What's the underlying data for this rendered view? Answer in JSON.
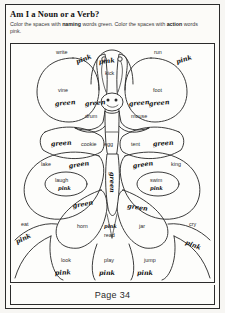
{
  "page": {
    "title": "Am I a Noun or a Verb?",
    "instruction_line1_pre": "Color the spaces with ",
    "instruction_line1_bold": "naming",
    "instruction_line1_post": " words green. Color the spaces with",
    "instruction_line2_bold": "action",
    "instruction_line2_post": " words pink.",
    "footer": "Page 34"
  },
  "legend": {
    "noun_color_word": "green",
    "verb_color_word": "pink",
    "green_hex": "#1e7a3c",
    "pink_hex": "#e06aa0"
  },
  "butterfly": {
    "description": "butterfly coloring diagram with word-filled wing spaces"
  },
  "cells": [
    {
      "id": "c01",
      "word": "write",
      "answer": "pink",
      "type": "verb"
    },
    {
      "id": "c02",
      "word": "kick",
      "answer": "pink",
      "type": "verb"
    },
    {
      "id": "c03",
      "word": "run",
      "answer": "pink",
      "type": "verb"
    },
    {
      "id": "c04",
      "word": "vine",
      "answer": "green",
      "type": "noun"
    },
    {
      "id": "c05",
      "word": "drum",
      "answer": "green",
      "type": "noun"
    },
    {
      "id": "c06",
      "word": "mouse",
      "answer": "green",
      "type": "noun"
    },
    {
      "id": "c07",
      "word": "foot",
      "answer": "green",
      "type": "noun"
    },
    {
      "id": "c08",
      "word": "cookie",
      "answer": "green",
      "type": "noun"
    },
    {
      "id": "c09",
      "word": "egg",
      "answer": "",
      "type": "noun"
    },
    {
      "id": "c10",
      "word": "tent",
      "answer": "green",
      "type": "noun"
    },
    {
      "id": "c11",
      "word": "lake",
      "answer": "green",
      "type": "noun"
    },
    {
      "id": "c12",
      "word": "king",
      "answer": "green",
      "type": "noun"
    },
    {
      "id": "c13",
      "word": "laugh",
      "answer": "pink",
      "type": "verb"
    },
    {
      "id": "c14",
      "word": "swim",
      "answer": "pink",
      "type": "verb"
    },
    {
      "id": "c15",
      "word": "body",
      "answer": "green",
      "type": "noun"
    },
    {
      "id": "c16",
      "word": "eat",
      "answer": "pink",
      "type": "verb"
    },
    {
      "id": "c17",
      "word": "horn",
      "answer": "green",
      "type": "noun"
    },
    {
      "id": "c18",
      "word": "read",
      "answer": "pink",
      "type": "verb"
    },
    {
      "id": "c19",
      "word": "jar",
      "answer": "green",
      "type": "noun"
    },
    {
      "id": "c20",
      "word": "cry",
      "answer": "pink",
      "type": "verb"
    },
    {
      "id": "c21",
      "word": "look",
      "answer": "pink",
      "type": "verb"
    },
    {
      "id": "c22",
      "word": "play",
      "answer": "pink",
      "type": "verb"
    },
    {
      "id": "c23",
      "word": "jump",
      "answer": "pink",
      "type": "verb"
    }
  ],
  "labels": {
    "write": "write",
    "kick": "kick",
    "run": "run",
    "vine": "vine",
    "drum": "drum",
    "mouse": "mouse",
    "foot": "foot",
    "cookie": "cookie",
    "egg": "egg",
    "tent": "tent",
    "lake": "lake",
    "king": "king",
    "laugh": "laugh",
    "swim": "swim",
    "eat": "eat",
    "horn": "horn",
    "read": "read",
    "jar": "jar",
    "cry": "cry",
    "look": "look",
    "play": "play",
    "jump": "jump",
    "pink_a": "pink",
    "pink_b": "pink",
    "pink_c": "pink",
    "pink_d": "pink",
    "pink_e": "pink",
    "pink_f": "pink",
    "pink_g": "pink",
    "pink_h": "pink",
    "pink_i": "pink",
    "pink_j": "pink",
    "pink_k": "pink",
    "green_a": "green",
    "green_b": "green",
    "green_c": "green",
    "green_d": "green",
    "green_e": "green",
    "green_f": "green",
    "green_g": "green",
    "green_h": "green",
    "green_i": "green",
    "green_j": "green",
    "green_k": "green",
    "green_l": "green",
    "green_m": "green"
  }
}
